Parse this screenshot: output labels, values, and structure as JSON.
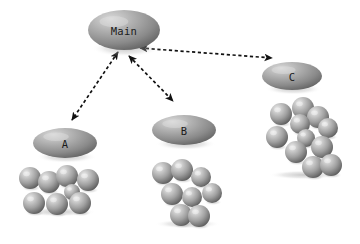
{
  "figure": {
    "background_color": "#ffffff",
    "width": 360,
    "height": 244
  },
  "palette": {
    "ellipse_light": "#cfcfcf",
    "ellipse_mid": "#9a9a9a",
    "ellipse_dark": "#5f5f5f",
    "sphere_light": "#e8e8e8",
    "sphere_mid": "#a6a6a6",
    "sphere_dark": "#5a5a5a",
    "arrow_color": "#111111",
    "label_color": "#1a1a1a",
    "shadow_color": "#bdbdbd"
  },
  "nodes": [
    {
      "id": "main",
      "label": "Main",
      "cx": 124,
      "cy": 30,
      "rx": 36,
      "ry": 20
    },
    {
      "id": "a",
      "label": "A",
      "cx": 65,
      "cy": 143,
      "rx": 32,
      "ry": 15
    },
    {
      "id": "b",
      "label": "B",
      "cx": 184,
      "cy": 130,
      "rx": 32,
      "ry": 15
    },
    {
      "id": "c",
      "label": "C",
      "cx": 292,
      "cy": 76,
      "rx": 30,
      "ry": 14
    }
  ],
  "connectors": [
    {
      "id": "main-c",
      "from": "main",
      "to": "c",
      "style": "dashed",
      "arrowheads": "both",
      "x1": 140,
      "y1": 48,
      "x2": 272,
      "y2": 58
    },
    {
      "id": "main-a",
      "from": "main",
      "to": "a",
      "style": "dashed",
      "arrowheads": "both",
      "x1": 118,
      "y1": 52,
      "x2": 72,
      "y2": 120
    },
    {
      "id": "main-b",
      "from": "main",
      "to": "b",
      "style": "dashed",
      "arrowheads": "both",
      "x1": 129,
      "y1": 56,
      "x2": 173,
      "y2": 101
    }
  ],
  "clusters": [
    {
      "id": "cluster-a",
      "belongs_to": "A",
      "count": 8,
      "spheres": [
        {
          "cx": 30,
          "cy": 178,
          "r": 11
        },
        {
          "cx": 49,
          "cy": 182,
          "r": 11
        },
        {
          "cx": 67,
          "cy": 176,
          "r": 11
        },
        {
          "cx": 88,
          "cy": 180,
          "r": 11
        },
        {
          "cx": 72,
          "cy": 192,
          "r": 8
        },
        {
          "cx": 34,
          "cy": 203,
          "r": 11
        },
        {
          "cx": 57,
          "cy": 204,
          "r": 11
        },
        {
          "cx": 80,
          "cy": 203,
          "r": 11
        }
      ]
    },
    {
      "id": "cluster-b",
      "belongs_to": "B",
      "count": 7,
      "spheres": [
        {
          "cx": 163,
          "cy": 173,
          "r": 11
        },
        {
          "cx": 182,
          "cy": 170,
          "r": 11
        },
        {
          "cx": 201,
          "cy": 177,
          "r": 10
        },
        {
          "cx": 172,
          "cy": 194,
          "r": 11
        },
        {
          "cx": 192,
          "cy": 197,
          "r": 10
        },
        {
          "cx": 212,
          "cy": 193,
          "r": 10
        },
        {
          "cx": 181,
          "cy": 215,
          "r": 11
        },
        {
          "cx": 199,
          "cy": 216,
          "r": 11
        }
      ]
    },
    {
      "id": "cluster-c",
      "belongs_to": "C",
      "count": 11,
      "spheres": [
        {
          "cx": 303,
          "cy": 108,
          "r": 11
        },
        {
          "cx": 281,
          "cy": 114,
          "r": 11
        },
        {
          "cx": 318,
          "cy": 117,
          "r": 11
        },
        {
          "cx": 300,
          "cy": 124,
          "r": 10
        },
        {
          "cx": 328,
          "cy": 128,
          "r": 10
        },
        {
          "cx": 277,
          "cy": 137,
          "r": 11
        },
        {
          "cx": 306,
          "cy": 138,
          "r": 9
        },
        {
          "cx": 322,
          "cy": 147,
          "r": 11
        },
        {
          "cx": 296,
          "cy": 152,
          "r": 11
        },
        {
          "cx": 313,
          "cy": 167,
          "r": 11
        },
        {
          "cx": 331,
          "cy": 165,
          "r": 11
        }
      ]
    }
  ]
}
